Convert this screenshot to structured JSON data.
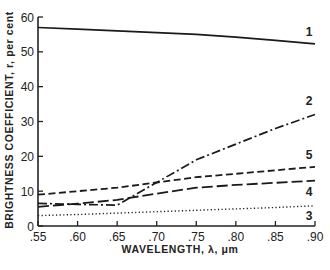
{
  "chart_data": {
    "type": "line",
    "title": "",
    "xlabel": "WAVELENGTH, λ, μm",
    "ylabel": "BRIGHTNESS COEFFICIENT, r, per cent",
    "xlim": [
      0.55,
      0.9
    ],
    "ylim": [
      0,
      60
    ],
    "xticks": [
      0.55,
      0.6,
      0.65,
      0.7,
      0.75,
      0.8,
      0.85,
      0.9
    ],
    "xtick_labels": [
      ".55",
      ".60",
      ".65",
      ".70",
      ".75",
      ".80",
      ".85",
      ".90"
    ],
    "yticks": [
      0,
      10,
      20,
      30,
      40,
      50,
      60
    ],
    "ytick_labels": [
      "0",
      "10",
      "20",
      "30",
      "40",
      "50",
      "60"
    ],
    "grid": false,
    "legend": "inline curve numbers at right end",
    "x": [
      0.55,
      0.6,
      0.65,
      0.7,
      0.75,
      0.8,
      0.85,
      0.9
    ],
    "series": [
      {
        "name": "1",
        "style": "solid",
        "values": [
          57,
          56.5,
          56,
          55.5,
          55,
          54.2,
          53.3,
          52.3
        ]
      },
      {
        "name": "2",
        "style": "dashdot",
        "values": [
          6.5,
          6.2,
          6.0,
          12.5,
          19,
          23.5,
          28,
          32
        ]
      },
      {
        "name": "3",
        "style": "dotted",
        "values": [
          3,
          3.3,
          3.7,
          4.1,
          4.5,
          4.9,
          5.3,
          5.8
        ]
      },
      {
        "name": "4",
        "style": "longdash",
        "values": [
          5.5,
          6.4,
          7.5,
          9.3,
          11,
          11.8,
          12.4,
          13
        ]
      },
      {
        "name": "5",
        "style": "dashed",
        "values": [
          9,
          10,
          11,
          12.5,
          14,
          15,
          16,
          17
        ]
      }
    ]
  }
}
